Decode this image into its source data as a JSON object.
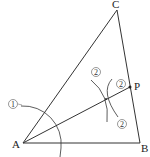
{
  "figure": {
    "type": "geometric-construction",
    "points": {
      "A": {
        "label": "A",
        "x": 23,
        "y": 143
      },
      "B": {
        "label": "B",
        "x": 140,
        "y": 143
      },
      "C": {
        "label": "C",
        "x": 117,
        "y": 10
      },
      "P": {
        "label": "P",
        "x": 130,
        "y": 87
      }
    },
    "step_marks": {
      "step1": "①",
      "step2_top": "②",
      "step2_near_p": "②",
      "step2_bottom": "②"
    },
    "colors": {
      "line": "#333333",
      "text": "#222222",
      "background": "#ffffff"
    }
  }
}
